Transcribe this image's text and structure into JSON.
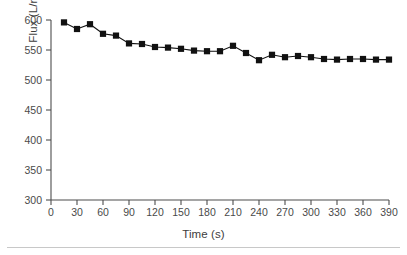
{
  "figure": {
    "background_color": "#ffffff",
    "axis_color": "#4d4d4d",
    "series_color": "#111111",
    "rule_color": "#c8c8c8"
  },
  "axes": {
    "x_title": "Time (s)",
    "y_title_prefix": "Flux (L/m",
    "y_title_exponent": "2",
    "y_title_suffix": "·h)",
    "y_title_full": "Flux (L/m²·h)",
    "x_ticks": [
      "0",
      "30",
      "60",
      "90",
      "120",
      "150",
      "180",
      "210",
      "240",
      "270",
      "300",
      "330",
      "360",
      "390"
    ],
    "y_ticks": [
      "600",
      "550",
      "500",
      "450",
      "400",
      "350",
      "300"
    ]
  },
  "chart_data": {
    "type": "scatter",
    "title": "",
    "subtitle": "",
    "xlabel": "Time (s)",
    "ylabel": "Flux (L/m²·h)",
    "xlim": [
      0,
      390
    ],
    "ylim": [
      300,
      600
    ],
    "xticks": [
      0,
      30,
      60,
      90,
      120,
      150,
      180,
      210,
      240,
      270,
      300,
      330,
      360,
      390
    ],
    "yticks": [
      300,
      350,
      400,
      450,
      500,
      550,
      600
    ],
    "grid": false,
    "legend": null,
    "marker": "square",
    "line": "solid",
    "series": [
      {
        "name": "Flux",
        "color": "#111111",
        "x": [
          15,
          30,
          45,
          60,
          75,
          90,
          105,
          120,
          135,
          150,
          165,
          180,
          195,
          210,
          225,
          240,
          255,
          270,
          285,
          300,
          315,
          330,
          345,
          360,
          375,
          390
        ],
        "y": [
          596,
          585,
          593,
          577,
          574,
          561,
          560,
          555,
          554,
          552,
          549,
          548,
          548,
          557,
          545,
          533,
          542,
          538,
          540,
          538,
          535,
          534,
          535,
          535,
          534,
          534
        ]
      }
    ]
  }
}
